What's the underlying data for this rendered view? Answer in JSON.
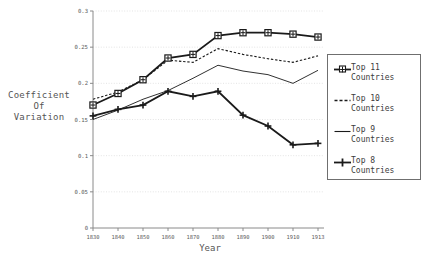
{
  "chart_data": {
    "type": "line",
    "title": "",
    "xlabel": "Year",
    "ylabel": "Coefficient\nOf\nVariation",
    "ylabel_lines": [
      "Coefficient",
      "Of",
      "Variation"
    ],
    "x": [
      "1830",
      "1840",
      "1850",
      "1860",
      "1870",
      "1880",
      "1890",
      "1900",
      "1910",
      "1913"
    ],
    "xtick_labels": [
      "1830",
      "1840",
      "1850",
      "1860",
      "1870",
      "1880",
      "1890",
      "1900",
      "1910",
      "1913"
    ],
    "ytick_labels": [
      "0",
      "0.05",
      "0.1",
      "0.15",
      "0.2",
      "0.25",
      "0.3"
    ],
    "ytick_values": [
      0,
      0.05,
      0.1,
      0.15,
      0.2,
      0.25,
      0.3
    ],
    "ylim": [
      0,
      0.3
    ],
    "grid": true,
    "legend_position": "right-outside",
    "series": [
      {
        "name": "Top 11\nCountries",
        "label_lines": [
          "Top 11",
          "Countries"
        ],
        "marker": "square-plus",
        "style": "solid-thick",
        "color": "#1a1a1a",
        "values": [
          0.17,
          0.186,
          0.205,
          0.235,
          0.24,
          0.266,
          0.27,
          0.27,
          0.268,
          0.264
        ]
      },
      {
        "name": "Top 10\nCountries",
        "label_lines": [
          "Top 10",
          "Countries"
        ],
        "marker": "none",
        "style": "dashed",
        "color": "#1a1a1a",
        "values": [
          0.178,
          0.188,
          0.205,
          0.232,
          0.229,
          0.248,
          0.24,
          0.234,
          0.229,
          0.238
        ]
      },
      {
        "name": "Top 9\nCountries",
        "label_lines": [
          "Top 9",
          "Countries"
        ],
        "marker": "none",
        "style": "solid-thin",
        "color": "#1a1a1a",
        "values": [
          0.15,
          0.163,
          0.178,
          0.19,
          0.207,
          0.225,
          0.217,
          0.212,
          0.2,
          0.218
        ]
      },
      {
        "name": "Top 8\nCountries",
        "label_lines": [
          "Top 8",
          "Countries"
        ],
        "marker": "plus",
        "style": "solid-thick",
        "color": "#1a1a1a",
        "values": [
          0.155,
          0.164,
          0.17,
          0.189,
          0.182,
          0.189,
          0.156,
          0.141,
          0.115,
          0.117
        ]
      }
    ]
  },
  "legend": {
    "items": [
      {
        "line1": "Top 11",
        "line2": "Countries"
      },
      {
        "line1": "Top 10",
        "line2": "Countries"
      },
      {
        "line1": "Top 9",
        "line2": "Countries"
      },
      {
        "line1": "Top 8",
        "line2": "Countries"
      }
    ]
  },
  "axes": {
    "x_title": "Year",
    "y_title_line1": "Coefficient",
    "y_title_line2": "Of",
    "y_title_line3": "Variation"
  }
}
